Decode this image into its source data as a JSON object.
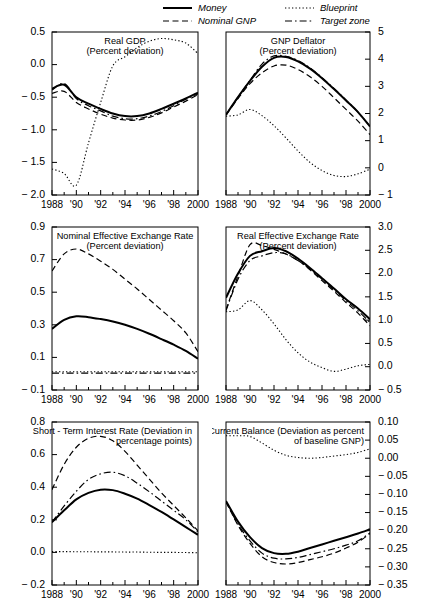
{
  "legend": {
    "items": [
      {
        "label": "Money",
        "style": "solid",
        "name": "legend-money"
      },
      {
        "label": "Nominal GNP",
        "style": "dashed",
        "name": "legend-nominal-gnp"
      },
      {
        "label": "Blueprint",
        "style": "dotted",
        "name": "legend-blueprint"
      },
      {
        "label": "Target zone",
        "style": "dash-dot",
        "name": "legend-target-zone"
      }
    ]
  },
  "xaxis": {
    "ticks": [
      1988,
      1990,
      1992,
      1994,
      1996,
      1998,
      2000
    ],
    "labels": [
      "1988",
      "'90",
      "'92",
      "'94",
      "'96",
      "'98",
      "2000"
    ],
    "min": 1988,
    "max": 2000,
    "minor_step": 1
  },
  "chart_data": [
    {
      "type": "line",
      "panel": 1,
      "title": "Real GDP",
      "subtitle": "(Percent deviation)",
      "title_align": "center",
      "axis_side": "left",
      "ylim": [
        -2.0,
        0.5
      ],
      "yticks": [
        -2.0,
        -1.5,
        -1.0,
        -0.5,
        0.0,
        0.5
      ],
      "yticklabels": [
        "− 2.0",
        "− 1.5",
        "− 1.0",
        "− 0.5",
        "0.0",
        "0.5"
      ],
      "x": [
        1988,
        1989,
        1990,
        1991,
        1992,
        1993,
        1994,
        1995,
        1996,
        1997,
        1998,
        1999,
        2000
      ],
      "series": [
        {
          "name": "Money",
          "style": "solid",
          "values": [
            -0.37,
            -0.31,
            -0.5,
            -0.6,
            -0.68,
            -0.75,
            -0.79,
            -0.79,
            -0.75,
            -0.68,
            -0.6,
            -0.52,
            -0.43
          ]
        },
        {
          "name": "Nominal GNP",
          "style": "dashed",
          "values": [
            -0.44,
            -0.41,
            -0.58,
            -0.68,
            -0.76,
            -0.82,
            -0.85,
            -0.85,
            -0.81,
            -0.74,
            -0.65,
            -0.56,
            -0.46
          ]
        },
        {
          "name": "Blueprint",
          "style": "dotted",
          "values": [
            -1.6,
            -1.67,
            -1.85,
            -1.2,
            -0.58,
            -0.02,
            0.12,
            0.26,
            0.36,
            0.4,
            0.38,
            0.33,
            0.17
          ]
        },
        {
          "name": "Target zone",
          "style": "dash-dot",
          "values": [
            -0.39,
            -0.29,
            -0.52,
            -0.63,
            -0.71,
            -0.79,
            -0.83,
            -0.83,
            -0.79,
            -0.72,
            -0.63,
            -0.53,
            -0.45
          ]
        }
      ]
    },
    {
      "type": "line",
      "panel": 2,
      "title": "GNP Deflator",
      "subtitle": "(Percent deviation)",
      "title_align": "center",
      "axis_side": "right",
      "ylim": [
        -1,
        5
      ],
      "yticks": [
        -1,
        0,
        1,
        2,
        3,
        4,
        5
      ],
      "yticklabels": [
        "− 1",
        "0",
        "1",
        "2",
        "3",
        "4",
        "5"
      ],
      "x": [
        1988,
        1989,
        1990,
        1991,
        1992,
        1993,
        1994,
        1995,
        1996,
        1997,
        1998,
        1999,
        2000
      ],
      "series": [
        {
          "name": "Money",
          "style": "solid",
          "values": [
            1.95,
            2.6,
            3.2,
            3.72,
            4.05,
            4.08,
            3.92,
            3.65,
            3.3,
            2.9,
            2.48,
            2.05,
            1.52
          ]
        },
        {
          "name": "Nominal GNP",
          "style": "dashed",
          "values": [
            1.95,
            2.55,
            3.1,
            3.5,
            3.75,
            3.78,
            3.62,
            3.35,
            3.0,
            2.58,
            2.15,
            1.72,
            1.22
          ]
        },
        {
          "name": "Blueprint",
          "style": "dotted",
          "values": [
            1.9,
            1.95,
            2.15,
            1.92,
            1.55,
            1.1,
            0.62,
            0.2,
            -0.1,
            -0.28,
            -0.32,
            -0.22,
            -0.05
          ]
        },
        {
          "name": "Target zone",
          "style": "dash-dot",
          "values": [
            1.95,
            2.6,
            3.22,
            3.82,
            4.12,
            4.1,
            3.95,
            3.68,
            3.32,
            2.92,
            2.5,
            2.05,
            1.52
          ]
        }
      ]
    },
    {
      "type": "line",
      "panel": 3,
      "title": "Nominal Effective Exchange Rate",
      "subtitle": "(Percent deviation)",
      "title_align": "center",
      "axis_side": "left",
      "ylim": [
        -0.1,
        0.9
      ],
      "yticks": [
        -0.1,
        0.1,
        0.3,
        0.5,
        0.7,
        0.9
      ],
      "yticklabels": [
        "− 0.1",
        "0.1",
        "0.3",
        "0.5",
        "0.7",
        "0.9"
      ],
      "x": [
        1988,
        1989,
        1990,
        1991,
        1992,
        1993,
        1994,
        1995,
        1996,
        1997,
        1998,
        1999,
        2000
      ],
      "series": [
        {
          "name": "Money",
          "style": "solid",
          "values": [
            0.275,
            0.33,
            0.352,
            0.347,
            0.335,
            0.32,
            0.3,
            0.275,
            0.245,
            0.212,
            0.178,
            0.14,
            0.092
          ]
        },
        {
          "name": "Nominal GNP",
          "style": "dashed",
          "values": [
            0.63,
            0.735,
            0.765,
            0.735,
            0.69,
            0.64,
            0.58,
            0.52,
            0.455,
            0.39,
            0.325,
            0.25,
            0.135
          ]
        },
        {
          "name": "Blueprint",
          "style": "dotted",
          "values": [
            0.012,
            0.012,
            0.012,
            0.012,
            0.012,
            0.012,
            0.012,
            0.012,
            0.012,
            0.012,
            0.012,
            0.012,
            0.012
          ]
        },
        {
          "name": "Target zone",
          "style": "dash-dot",
          "values": [
            0.004,
            0.004,
            0.004,
            0.004,
            0.004,
            0.004,
            0.004,
            0.004,
            0.004,
            0.004,
            0.004,
            0.004,
            0.004
          ]
        }
      ]
    },
    {
      "type": "line",
      "panel": 4,
      "title": "Real Effective Exchange Rate",
      "subtitle": "(Percent deviation)",
      "title_align": "center",
      "axis_side": "right",
      "ylim": [
        -0.5,
        3.0
      ],
      "yticks": [
        -0.5,
        0.0,
        0.5,
        1.0,
        1.5,
        2.0,
        2.5,
        3.0
      ],
      "yticklabels": [
        "− 0.5",
        "0.0",
        "0.5",
        "1.0",
        "1.5",
        "2.0",
        "2.5",
        "3.0"
      ],
      "x": [
        1988,
        1989,
        1990,
        1991,
        1992,
        1993,
        1994,
        1995,
        1996,
        1997,
        1998,
        1999,
        2000
      ],
      "series": [
        {
          "name": "Money",
          "style": "solid",
          "values": [
            1.48,
            2.0,
            2.38,
            2.48,
            2.55,
            2.48,
            2.32,
            2.12,
            1.9,
            1.68,
            1.45,
            1.25,
            1.02
          ]
        },
        {
          "name": "Nominal GNP",
          "style": "dashed",
          "values": [
            1.22,
            1.95,
            2.62,
            2.6,
            2.52,
            2.42,
            2.28,
            2.08,
            1.85,
            1.62,
            1.38,
            1.15,
            0.88
          ]
        },
        {
          "name": "Blueprint",
          "style": "dotted",
          "values": [
            1.18,
            1.22,
            1.42,
            1.22,
            0.92,
            0.58,
            0.3,
            0.1,
            -0.02,
            -0.1,
            -0.05,
            0.02,
            0.05
          ]
        },
        {
          "name": "Target zone",
          "style": "dash-dot",
          "values": [
            1.2,
            1.88,
            2.28,
            2.38,
            2.45,
            2.42,
            2.28,
            2.1,
            1.88,
            1.65,
            1.42,
            1.2,
            0.95
          ]
        }
      ]
    },
    {
      "type": "line",
      "panel": 5,
      "title": "Short - Term Interest Rate (Deviation in",
      "subtitle": "percentage points)",
      "title_align": "right",
      "axis_side": "left",
      "ylim": [
        -0.2,
        0.8
      ],
      "yticks": [
        -0.2,
        0.0,
        0.2,
        0.4,
        0.6,
        0.8
      ],
      "yticklabels": [
        "− 0.2",
        "0.0",
        "0.2",
        "0.4",
        "0.6",
        "0.8"
      ],
      "x": [
        1988,
        1989,
        1990,
        1991,
        1992,
        1993,
        1994,
        1995,
        1996,
        1997,
        1998,
        1999,
        2000
      ],
      "series": [
        {
          "name": "Money",
          "style": "solid",
          "values": [
            0.185,
            0.258,
            0.325,
            0.365,
            0.385,
            0.382,
            0.36,
            0.33,
            0.29,
            0.248,
            0.202,
            0.155,
            0.108
          ]
        },
        {
          "name": "Nominal GNP",
          "style": "dashed",
          "values": [
            0.385,
            0.54,
            0.645,
            0.7,
            0.712,
            0.685,
            0.62,
            0.535,
            0.45,
            0.365,
            0.288,
            0.212,
            0.132
          ]
        },
        {
          "name": "Blueprint",
          "style": "dotted",
          "values": [
            0.005,
            0.005,
            0.004,
            0.004,
            0.003,
            0.003,
            0.002,
            0.002,
            0.001,
            0.0,
            0.0,
            -0.001,
            -0.002
          ]
        },
        {
          "name": "Target zone",
          "style": "dash-dot",
          "values": [
            0.185,
            0.285,
            0.375,
            0.448,
            0.482,
            0.492,
            0.47,
            0.425,
            0.372,
            0.315,
            0.258,
            0.2,
            0.125
          ]
        }
      ]
    },
    {
      "type": "line",
      "panel": 6,
      "title": "Current Balance (Deviation as percent",
      "subtitle": "of baseline GNP)",
      "title_align": "right",
      "axis_side": "right",
      "ylim": [
        -0.35,
        0.1
      ],
      "yticks": [
        -0.35,
        -0.3,
        -0.25,
        -0.2,
        -0.15,
        -0.1,
        -0.05,
        0.0,
        0.05,
        0.1
      ],
      "yticklabels": [
        "− 0.35",
        "− 0.30",
        "− 0.25",
        "− 0.20",
        "− 0.15",
        "− 0.10",
        "− 0.05",
        "0.00",
        "0.05",
        "0.10"
      ],
      "x": [
        1988,
        1989,
        1990,
        1991,
        1992,
        1993,
        1994,
        1995,
        1996,
        1997,
        1998,
        1999,
        2000
      ],
      "series": [
        {
          "name": "Money",
          "style": "solid",
          "values": [
            -0.118,
            -0.175,
            -0.218,
            -0.248,
            -0.262,
            -0.264,
            -0.258,
            -0.248,
            -0.238,
            -0.228,
            -0.218,
            -0.208,
            -0.196
          ]
        },
        {
          "name": "Nominal GNP",
          "style": "dashed",
          "values": [
            -0.12,
            -0.185,
            -0.235,
            -0.272,
            -0.288,
            -0.292,
            -0.288,
            -0.28,
            -0.272,
            -0.262,
            -0.248,
            -0.232,
            -0.208
          ]
        },
        {
          "name": "Blueprint",
          "style": "dotted",
          "values": [
            0.062,
            0.062,
            0.06,
            0.042,
            0.022,
            0.008,
            0.002,
            0.0,
            0.002,
            0.006,
            0.01,
            0.016,
            0.026
          ]
        },
        {
          "name": "Target zone",
          "style": "dash-dot",
          "values": [
            -0.12,
            -0.182,
            -0.228,
            -0.262,
            -0.276,
            -0.278,
            -0.274,
            -0.266,
            -0.258,
            -0.25,
            -0.24,
            -0.228,
            -0.206
          ]
        }
      ]
    }
  ]
}
